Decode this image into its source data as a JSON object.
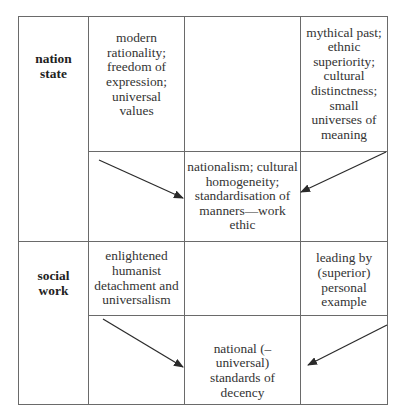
{
  "diagram": {
    "rows": [
      {
        "label": "nation state",
        "top_left": "modern rationality; freedom of expression; universal values",
        "top_right": "mythical past; ethnic superiority; cultural distinctness; small universes of meaning",
        "result": "nationalism; cultural homogeneity; standardisation of manners—work ethic"
      },
      {
        "label": "social work",
        "top_left": "enlightened humanist detachment and universalism",
        "top_right": "leading by (superior) personal example",
        "result": "national (– universal) standards of decency"
      }
    ],
    "arrows": [
      {
        "from": "nation-state-top-left",
        "to": "nation-state-result",
        "x1": 99,
        "y1": 160,
        "x2": 183,
        "y2": 198
      },
      {
        "from": "nation-state-top-right",
        "to": "nation-state-result",
        "x1": 386,
        "y1": 152,
        "x2": 301,
        "y2": 192
      },
      {
        "from": "social-work-top-left",
        "to": "social-work-result",
        "x1": 103,
        "y1": 319,
        "x2": 183,
        "y2": 367
      },
      {
        "from": "social-work-top-right",
        "to": "social-work-result",
        "x1": 387,
        "y1": 325,
        "x2": 308,
        "y2": 365
      }
    ],
    "colors": {
      "line": "#6a6a6a",
      "arrow": "#2a2a2a",
      "text": "#333333"
    }
  }
}
